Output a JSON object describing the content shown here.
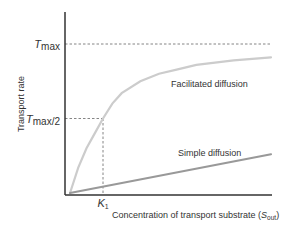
{
  "chart_data": {
    "type": "line",
    "title": "",
    "xlabel": {
      "text": "Concentration of transport substrate (",
      "var": "S",
      "sub": "out",
      "close": ")"
    },
    "ylabel": "Transport rate",
    "xlim": [
      0,
      10
    ],
    "ylim": [
      0,
      1.2
    ],
    "grid": false,
    "reference_lines": {
      "tmax": {
        "label_main": "T",
        "label_sub": "max",
        "label_suffix": "",
        "y": 1.0
      },
      "tmax_half": {
        "label_main": "T",
        "label_sub": "max",
        "label_suffix": "/2",
        "y": 0.5
      },
      "k1": {
        "label_main": "K",
        "label_sub": "1",
        "x": 1.0
      }
    },
    "series": [
      {
        "name": "Facilitated diffusion",
        "color": "#cccccc",
        "kind": "saturating",
        "Tmax": 1.0,
        "K": 1.0,
        "x": [
          0,
          0.25,
          0.5,
          0.75,
          1.0,
          1.5,
          2,
          3,
          4,
          5,
          6,
          7,
          8,
          9,
          10
        ],
        "values": [
          0.0,
          0.17,
          0.3,
          0.4,
          0.5,
          0.6,
          0.67,
          0.75,
          0.8,
          0.83,
          0.86,
          0.875,
          0.89,
          0.9,
          0.91
        ]
      },
      {
        "name": "Simple diffusion",
        "color": "#999999",
        "kind": "linear",
        "x": [
          0,
          10
        ],
        "values": [
          0.0,
          0.26
        ]
      }
    ],
    "annotations": [
      {
        "text": "Facilitated diffusion",
        "series": 0
      },
      {
        "text": "Simple diffusion",
        "series": 1
      }
    ]
  }
}
